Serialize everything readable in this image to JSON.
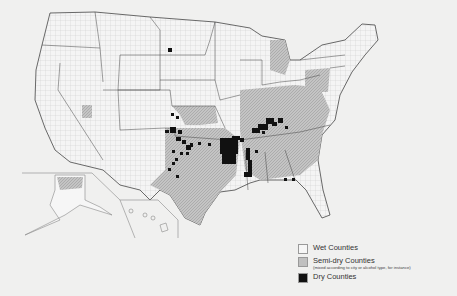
{
  "map": {
    "subject": "United States counties by alcohol sale status",
    "background_color": "#f0f0ef",
    "colors": {
      "wet": "#f4f4f4",
      "semi_dry": "#bdbdbd",
      "dry": "#111111",
      "borders": "#555555"
    },
    "insets": [
      "Alaska",
      "Hawaii"
    ]
  },
  "legend": {
    "items": [
      {
        "key": "wet",
        "label": "Wet Counties",
        "note": ""
      },
      {
        "key": "semi_dry",
        "label": "Semi-dry Counties",
        "note": "(mixed according to city or alcohol type, for instance)"
      },
      {
        "key": "dry",
        "label": "Dry Counties",
        "note": ""
      }
    ]
  }
}
